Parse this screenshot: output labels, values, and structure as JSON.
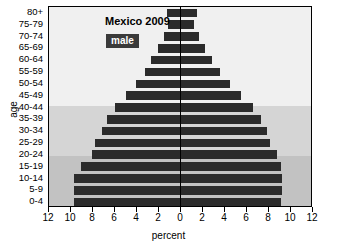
{
  "chart_data": {
    "type": "bar",
    "subtype": "population-pyramid",
    "title": "Mexico 2009",
    "xlabel": "percent",
    "ylabel": "age",
    "xlim": [
      -12,
      12
    ],
    "xticks": [
      12,
      10,
      8,
      6,
      4,
      2,
      0,
      2,
      4,
      6,
      8,
      10,
      12
    ],
    "grid": false,
    "legend_position": "inside-top",
    "categories": [
      "0-4",
      "5-9",
      "10-14",
      "15-19",
      "20-24",
      "25-29",
      "30-34",
      "35-39",
      "40-44",
      "45-49",
      "50-54",
      "55-59",
      "60-64",
      "65-69",
      "70-74",
      "75-79",
      "80+"
    ],
    "series": [
      {
        "name": "male",
        "side": "left",
        "color": "#2b2b2b",
        "values": [
          9.6,
          9.6,
          9.6,
          9.0,
          8.0,
          7.7,
          7.1,
          6.6,
          5.9,
          4.9,
          4.0,
          3.2,
          2.6,
          2.0,
          1.5,
          1.1,
          1.2
        ]
      },
      {
        "name": "female",
        "side": "right",
        "color": "#2b2b2b",
        "values": [
          9.2,
          9.3,
          9.3,
          9.2,
          8.8,
          8.2,
          7.9,
          7.4,
          6.6,
          5.5,
          4.5,
          3.6,
          2.9,
          2.3,
          1.7,
          1.3,
          1.5
        ]
      }
    ]
  },
  "chart": {
    "title": "Mexico 2009",
    "xlabel": "percent",
    "ylabel": "age",
    "legend": {
      "male": "male",
      "female": "female"
    },
    "colors": {
      "bar": "#2b2b2b",
      "band_light": "#f0f0f0",
      "band_mid": "#d5d5d5",
      "band_dark": "#c2c2c2",
      "axis": "#000000",
      "badge_bg": "#3a3a3a",
      "badge_text": "#ffffff"
    }
  }
}
